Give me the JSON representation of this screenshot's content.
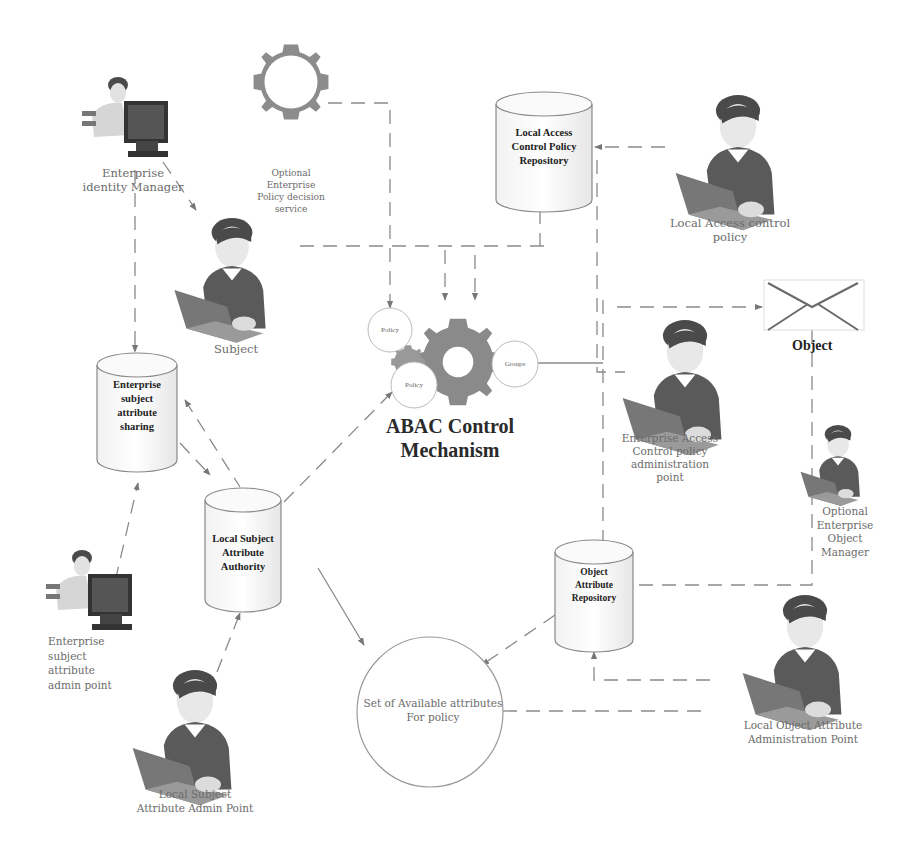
{
  "diagram": {
    "title": "ABAC Control Mechanism",
    "title_lines": [
      "ABAC Control",
      "Mechanism"
    ],
    "mechanism_circles": {
      "policy_top": "Policy",
      "policy_bottom": "Policy",
      "groups": "Groups"
    },
    "nodes": {
      "enterprise_identity_manager": {
        "lines": [
          "Enterprise",
          "identity Manager"
        ]
      },
      "optional_policy_service": {
        "lines": [
          "Optional",
          "Enterprise",
          "Policy decision",
          "service"
        ]
      },
      "local_access_repo": {
        "lines": [
          "Local Access",
          "Control Policy",
          "Repository"
        ]
      },
      "local_access_control_policy": {
        "lines": [
          "Local Access control",
          "policy"
        ]
      },
      "subject": {
        "lines": [
          "Subject"
        ]
      },
      "object": {
        "label": "Object"
      },
      "enterprise_subject_sharing": {
        "lines": [
          "Enterprise",
          "subject",
          "attribute",
          "sharing"
        ]
      },
      "enterprise_access_admin": {
        "lines": [
          "Enterprise Access",
          "Control policy",
          "administration",
          "point"
        ]
      },
      "local_subject_authority": {
        "lines": [
          "Local Subject",
          "Attribute",
          "Authority"
        ]
      },
      "optional_object_manager": {
        "lines": [
          "Optional",
          "Enterprise",
          "Object",
          "Manager"
        ]
      },
      "object_attr_repo": {
        "lines": [
          "Object",
          "Attribute",
          "Repository"
        ]
      },
      "enterprise_subject_admin": {
        "lines": [
          "Enterprise",
          "subject",
          "attribute",
          "admin point"
        ]
      },
      "available_attributes": {
        "lines": [
          "Set of Available attributes",
          "For policy"
        ]
      },
      "local_object_admin": {
        "lines": [
          "Local Object Attribute",
          "Administration Point"
        ]
      },
      "local_subject_admin": {
        "lines": [
          "Local Subject",
          "Attribute Admin Point"
        ]
      }
    },
    "colors": {
      "line": "#8a8a8a",
      "gear": "#8c8c8c",
      "sweater": "#555555",
      "hair": "#4a4a4a",
      "text": "#6b6b6b"
    }
  }
}
